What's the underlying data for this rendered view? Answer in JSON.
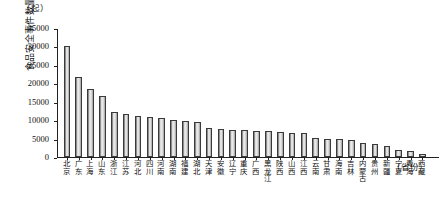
{
  "chart_data": {
    "type": "bar",
    "title": "",
    "subtitle": "",
    "unit_caption": "（起）",
    "ylabel": "食品安全事件数量",
    "xlabel": "（省份）",
    "ylim": [
      0,
      35000
    ],
    "ytick_labels": [
      "35000",
      "30000",
      "25000",
      "20000",
      "15000",
      "10000",
      "5000",
      "0"
    ],
    "ytick_values": [
      35000,
      30000,
      25000,
      20000,
      15000,
      10000,
      5000,
      0
    ],
    "grid": false,
    "legend": "none",
    "categories": [
      "北京",
      "广东",
      "上海",
      "山东",
      "浙江",
      "江苏",
      "河北",
      "四川",
      "河南",
      "湖南",
      "福建",
      "湖北",
      "天津",
      "安徽",
      "辽宁",
      "重庆",
      "广西",
      "黑龙江",
      "陕西",
      "山西",
      "江西",
      "云南",
      "甘肃",
      "海南",
      "吉林",
      "内蒙古",
      "贵州",
      "新疆",
      "宁夏",
      "青海",
      "西藏"
    ],
    "values": [
      30300,
      21800,
      18500,
      16800,
      12300,
      11700,
      11100,
      10900,
      10700,
      10200,
      9900,
      9500,
      7800,
      7700,
      7500,
      7300,
      7200,
      7000,
      6900,
      6700,
      6500,
      5100,
      5000,
      4800,
      4600,
      3900,
      3500,
      3000,
      1900,
      1600,
      700
    ]
  }
}
